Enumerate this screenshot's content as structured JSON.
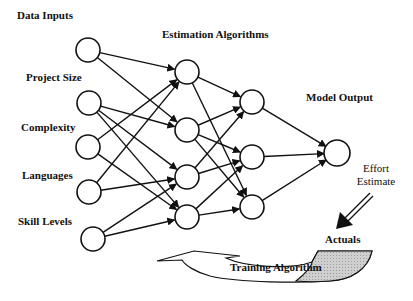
{
  "diagram": {
    "title_inputs": "Data Inputs",
    "title_hidden": "Estimation Algorithms",
    "title_output": "Model Output",
    "input_labels": [
      "Project Size",
      "Complexity",
      "Languages",
      "Skill Levels"
    ],
    "output_label_line1": "Effort",
    "output_label_line2": "Estimate",
    "actuals_label": "Actuals",
    "training_label": "Training Algorithm",
    "colors": {
      "stroke": "#111111",
      "background": "#ffffff",
      "shade": "#bdbdbd"
    },
    "layers": {
      "input": [
        [
          88,
          50
        ],
        [
          89,
          103
        ],
        [
          88,
          147
        ],
        [
          89,
          192
        ],
        [
          93,
          239
        ]
      ],
      "hidden1": [
        [
          187,
          72
        ],
        [
          187,
          130
        ],
        [
          187,
          177
        ],
        [
          187,
          217
        ]
      ],
      "hidden2": [
        [
          252,
          102
        ],
        [
          252,
          157
        ],
        [
          252,
          207
        ]
      ],
      "output": [
        [
          337,
          153
        ]
      ]
    },
    "edges": [
      [
        "input",
        0,
        "hidden1",
        0
      ],
      [
        "input",
        0,
        "hidden1",
        1
      ],
      [
        "input",
        1,
        "hidden1",
        1
      ],
      [
        "input",
        1,
        "hidden1",
        2
      ],
      [
        "input",
        1,
        "hidden1",
        3
      ],
      [
        "input",
        2,
        "hidden1",
        0
      ],
      [
        "input",
        2,
        "hidden1",
        3
      ],
      [
        "input",
        3,
        "hidden1",
        0
      ],
      [
        "input",
        3,
        "hidden1",
        2
      ],
      [
        "input",
        4,
        "hidden1",
        2
      ],
      [
        "input",
        4,
        "hidden1",
        3
      ],
      [
        "hidden1",
        0,
        "hidden2",
        0
      ],
      [
        "hidden1",
        0,
        "hidden2",
        2
      ],
      [
        "hidden1",
        1,
        "hidden2",
        0
      ],
      [
        "hidden1",
        1,
        "hidden2",
        1
      ],
      [
        "hidden1",
        1,
        "hidden2",
        2
      ],
      [
        "hidden1",
        2,
        "hidden2",
        0
      ],
      [
        "hidden1",
        2,
        "hidden2",
        1
      ],
      [
        "hidden1",
        3,
        "hidden2",
        1
      ],
      [
        "hidden1",
        3,
        "hidden2",
        2
      ],
      [
        "hidden2",
        0,
        "output",
        0
      ],
      [
        "hidden2",
        1,
        "output",
        0
      ],
      [
        "hidden2",
        2,
        "output",
        0
      ]
    ]
  }
}
